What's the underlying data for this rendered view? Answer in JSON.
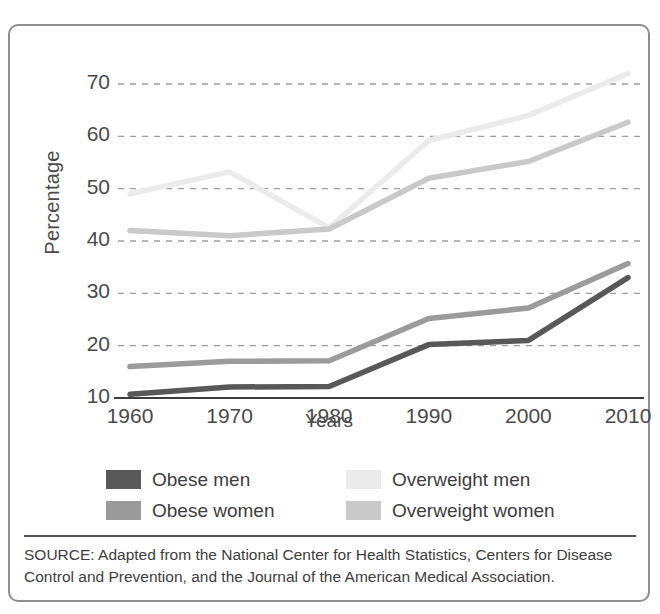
{
  "top_cut_text": " ",
  "figure": {
    "ylabel": "Percentage",
    "xlabel": "Years",
    "source_note": "SOURCE: Adapted from the National Center for Health Statistics, Centers for Disease Control and Prevention, and the Journal of the American Medical Association."
  },
  "legend": {
    "items": [
      {
        "label": "Obese men",
        "color": "#585858"
      },
      {
        "label": "Overweight men",
        "color": "#ebebeb"
      },
      {
        "label": "Obese women",
        "color": "#9b9b9b"
      },
      {
        "label": "Overweight women",
        "color": "#c9c9c9"
      }
    ]
  },
  "chart_data": {
    "type": "line",
    "title": "",
    "xlabel": "Years",
    "ylabel": "Percentage",
    "x": [
      1960,
      1970,
      1980,
      1990,
      2000,
      2010
    ],
    "categories": [
      "1960",
      "1970",
      "1980",
      "1990",
      "2000",
      "2010"
    ],
    "xlim": [
      1960,
      2010
    ],
    "ylim": [
      8,
      74
    ],
    "yticks": [
      10,
      20,
      30,
      40,
      50,
      60,
      70
    ],
    "ytick_labels": [
      "10",
      "20",
      "30",
      "40",
      "50",
      "60",
      "70"
    ],
    "xticks": [
      1960,
      1970,
      1980,
      1990,
      2000,
      2010
    ],
    "xtick_labels": [
      "1960",
      "1970",
      "1980",
      "1990",
      "2000",
      "2010"
    ],
    "grid": "horizontal-dashed",
    "legend_position": "below-plot",
    "series": [
      {
        "name": "Obese men",
        "color": "#585858",
        "values": [
          10.7,
          12.1,
          12.2,
          20.2,
          21.0,
          33.0
        ]
      },
      {
        "name": "Obese women",
        "color": "#9b9b9b",
        "values": [
          16.0,
          17.0,
          17.1,
          25.2,
          27.2,
          35.7
        ]
      },
      {
        "name": "Overweight men",
        "color": "#ebebeb",
        "values": [
          49.0,
          53.2,
          42.5,
          59.2,
          64.0,
          72.0
        ]
      },
      {
        "name": "Overweight women",
        "color": "#c9c9c9",
        "values": [
          42.0,
          41.0,
          42.3,
          52.0,
          55.2,
          62.7
        ]
      }
    ]
  }
}
